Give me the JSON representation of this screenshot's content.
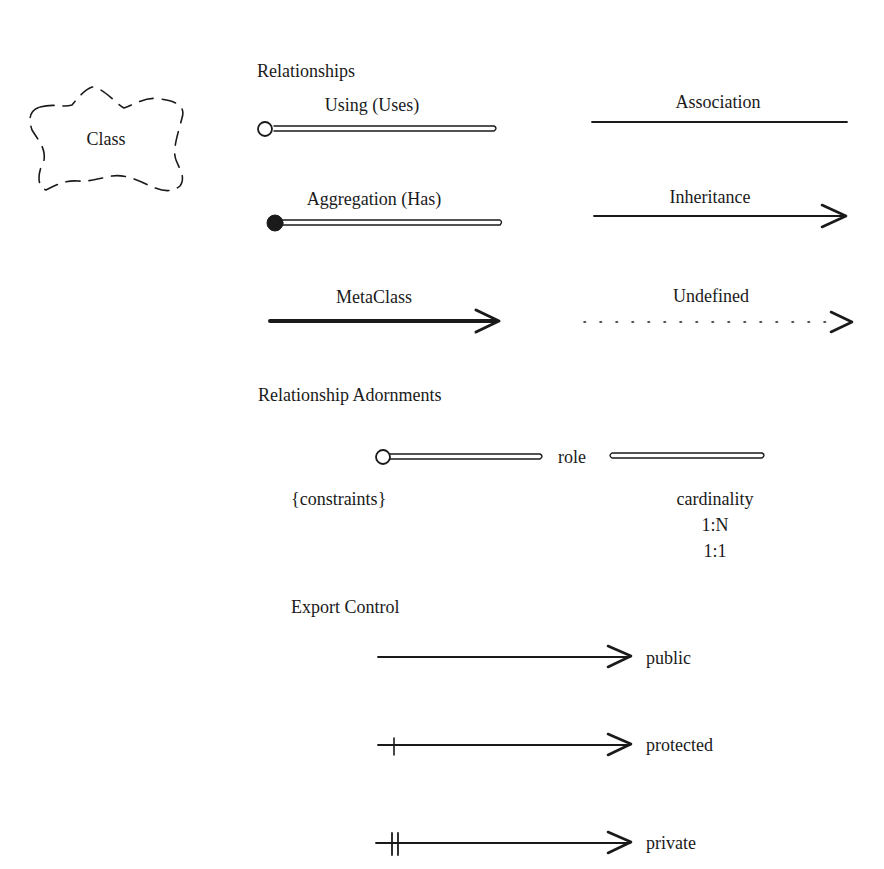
{
  "class_icon": {
    "label": "Class",
    "shape": "cloud-dashed"
  },
  "relationships": {
    "heading": "Relationships",
    "items": [
      {
        "label": "Using (Uses)",
        "style": "double-line-open-circle"
      },
      {
        "label": "Association",
        "style": "solid-line"
      },
      {
        "label": "Aggregation (Has)",
        "style": "double-line-filled-circle"
      },
      {
        "label": "Inheritance",
        "style": "solid-arrow"
      },
      {
        "label": "MetaClass",
        "style": "thick-arrow"
      },
      {
        "label": "Undefined",
        "style": "dotted-arrow"
      }
    ]
  },
  "adornments": {
    "heading": "Relationship Adornments",
    "role": "role",
    "constraints": "{constraints}",
    "cardinality": {
      "label": "cardinality",
      "values": [
        "1:N",
        "1:1"
      ]
    }
  },
  "export_control": {
    "heading": "Export Control",
    "items": [
      {
        "label": "public",
        "ticks": 0
      },
      {
        "label": "protected",
        "ticks": 1
      },
      {
        "label": "private",
        "ticks": 2
      }
    ]
  },
  "colors": {
    "ink": "#1a1a1a",
    "background": "#ffffff"
  }
}
